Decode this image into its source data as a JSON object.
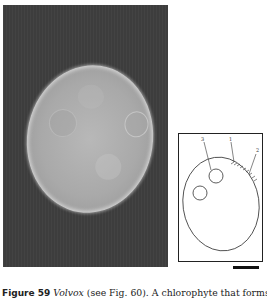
{
  "figure": {
    "photo": {
      "subject": "Volvox colony micrograph",
      "background_color": "#3d3d3d"
    },
    "diagram": {
      "labels": [
        "3",
        "1",
        "2"
      ]
    },
    "caption": {
      "figure_label": "Figure 59",
      "genus": "Volvox",
      "text": " (see Fig. 60). A chlorophyte that forms",
      "second_line_partial": "large colonies (not ... ) ... The cell ..."
    }
  }
}
